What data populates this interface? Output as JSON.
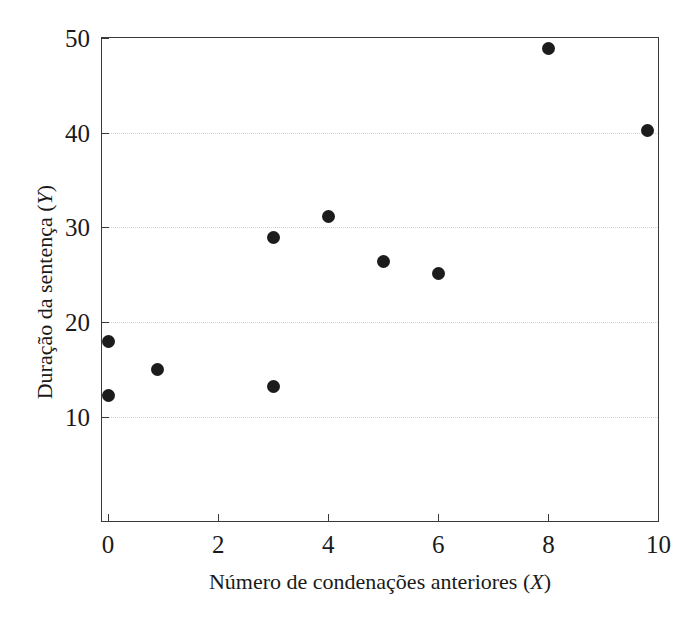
{
  "chart_data": {
    "type": "scatter",
    "title": "",
    "xlabel": "Número de condenações anteriores (X)",
    "ylabel": "Duração da sentença (Y)",
    "xlabel_text": "Número de condenações anteriores",
    "xlabel_var": "X",
    "ylabel_text": "Duração da sentença",
    "ylabel_var": "Y",
    "xlim": [
      -0.11,
      9.99
    ],
    "ylim": [
      -1.0,
      50.0
    ],
    "xticks": [
      0,
      2,
      4,
      6,
      8,
      10
    ],
    "yticks": [
      10,
      20,
      30,
      40,
      50
    ],
    "xtick_labels": [
      "0",
      "2",
      "4",
      "6",
      "8",
      "10"
    ],
    "ytick_labels": [
      "10",
      "20",
      "30",
      "40",
      "50"
    ],
    "grid": true,
    "grid_axis": "y",
    "grid_style": "dotted",
    "legend": false,
    "marker": "filled-circle",
    "marker_color": "#1c1c1c",
    "marker_size": 13,
    "axis_color": "#3a3a3a",
    "grid_color": "#d2d2d2",
    "background": "#ffffff",
    "points": [
      {
        "x": 0.0,
        "y": 18.0
      },
      {
        "x": 0.0,
        "y": 12.2
      },
      {
        "x": 0.9,
        "y": 15.0
      },
      {
        "x": 3.0,
        "y": 28.9
      },
      {
        "x": 3.0,
        "y": 13.2
      },
      {
        "x": 4.0,
        "y": 31.2
      },
      {
        "x": 5.0,
        "y": 26.4
      },
      {
        "x": 6.0,
        "y": 25.1
      },
      {
        "x": 8.0,
        "y": 48.9
      },
      {
        "x": 9.8,
        "y": 40.2
      }
    ],
    "x": [
      0.0,
      0.0,
      0.9,
      3.0,
      3.0,
      4.0,
      5.0,
      6.0,
      8.0,
      9.8
    ],
    "values": [
      18.0,
      12.2,
      15.0,
      28.9,
      13.2,
      31.2,
      26.4,
      25.1,
      48.9,
      40.2
    ]
  }
}
